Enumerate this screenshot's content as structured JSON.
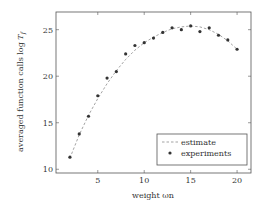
{
  "chart_data": {
    "type": "line",
    "title": "",
    "xlabel": "weight ωn",
    "ylabel": "averaged function calls log T_f",
    "xlim": [
      0.5,
      21.5
    ],
    "ylim": [
      9.6,
      26.9
    ],
    "xticks": [
      5,
      10,
      15,
      20
    ],
    "yticks": [
      10,
      15,
      20,
      25
    ],
    "grid": false,
    "legend_position": "lower right",
    "series": [
      {
        "name": "estimate",
        "style": "dashed-line",
        "color": "#999999",
        "x": [
          2,
          3,
          4,
          5,
          6,
          7,
          8,
          9,
          10,
          11,
          12,
          13,
          14,
          15,
          16,
          17,
          18,
          19,
          20
        ],
        "values": [
          11.2,
          13.7,
          15.8,
          17.6,
          19.2,
          20.6,
          21.8,
          22.8,
          23.6,
          24.2,
          24.7,
          25.1,
          25.3,
          25.4,
          25.3,
          25.0,
          24.5,
          23.8,
          22.9
        ]
      },
      {
        "name": "experiments",
        "style": "markers",
        "color": "#333333",
        "x": [
          2,
          3,
          4,
          5,
          6,
          7,
          8,
          9,
          10,
          11,
          12,
          13,
          14,
          15,
          16,
          17,
          18,
          19,
          20
        ],
        "values": [
          11.3,
          13.8,
          15.7,
          17.9,
          19.8,
          20.5,
          22.4,
          23.3,
          23.6,
          24.1,
          24.7,
          25.2,
          25.0,
          25.4,
          24.8,
          25.2,
          24.4,
          23.9,
          22.9
        ]
      }
    ]
  },
  "labels": {
    "x_axis": "weight ωn",
    "y_axis_prefix": "averaged function calls log ",
    "y_axis_var": "T",
    "y_axis_sub": "f"
  },
  "legend": {
    "items": [
      "estimate",
      "experiments"
    ]
  }
}
